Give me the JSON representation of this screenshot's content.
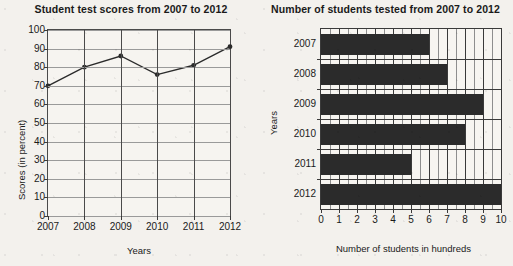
{
  "chart_data": [
    {
      "type": "line",
      "title": "Student test scores from 2007 to 2012",
      "xlabel": "Years",
      "ylabel": "Scores (in percent)",
      "categories": [
        "2007",
        "2008",
        "2009",
        "2010",
        "2011",
        "2012"
      ],
      "values": [
        70,
        80,
        86,
        76,
        81,
        91
      ],
      "ylim": [
        0,
        100
      ],
      "yticks": [
        "0",
        "10",
        "20",
        "30",
        "40",
        "50",
        "60",
        "70",
        "80",
        "90",
        "100"
      ],
      "ytick_values": [
        0,
        10,
        20,
        30,
        40,
        50,
        60,
        70,
        80,
        90,
        100
      ],
      "grid": "horizontal-and-vertical",
      "legend": "none",
      "marker": "filled-circle",
      "line_color": "#2b2b2b"
    },
    {
      "type": "bar",
      "orientation": "horizontal",
      "title": "Number of students tested from 2007 to 2012",
      "xlabel": "Number of students in hundreds",
      "ylabel": "Years",
      "categories": [
        "2007",
        "2008",
        "2009",
        "2010",
        "2011",
        "2012"
      ],
      "values": [
        6,
        7,
        9,
        8,
        5,
        10
      ],
      "xlim": [
        0,
        10
      ],
      "xticks": [
        "0",
        "1",
        "2",
        "3",
        "4",
        "5",
        "6",
        "7",
        "8",
        "9",
        "10"
      ],
      "xtick_values": [
        0,
        1,
        2,
        3,
        4,
        5,
        6,
        7,
        8,
        9,
        10
      ],
      "grid": "vertical",
      "legend": "none",
      "bar_color": "#2b2b2b"
    }
  ]
}
